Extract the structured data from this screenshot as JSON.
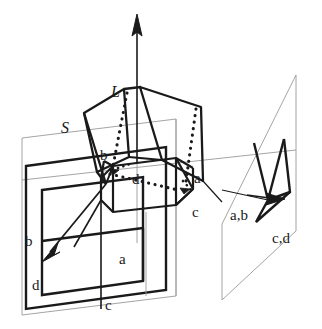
{
  "figure": {
    "background_color": "#ffffff",
    "ink_color": "#1a1a1a",
    "thin_line_color": "#8c8c8c",
    "width": 322,
    "height": 329
  },
  "labels": {
    "line_L": "L",
    "surface_S": "S",
    "left_plane": {
      "corner_b": "b",
      "corner_a": "a",
      "corner_d": "d",
      "corner_c": "c"
    },
    "surface_corners": {
      "corner_b": "b",
      "corner_d": "d",
      "corner_a": "a",
      "corner_c": "c"
    },
    "right_plane": {
      "corner_ab": "a,b",
      "corner_cd": "c,d"
    }
  },
  "geometry": {
    "axis_arrow": {
      "name": "vertical-axis-L",
      "from": [
        137,
        163
      ],
      "to": [
        137,
        16
      ]
    },
    "left_image_plane_outline": [
      [
        22,
        138
      ],
      [
        176,
        119
      ],
      [
        176,
        296
      ],
      [
        22,
        315
      ]
    ],
    "left_plane_thick_quad": [
      [
        26,
        166
      ],
      [
        166,
        147
      ],
      [
        166,
        290
      ],
      [
        26,
        309
      ]
    ],
    "left_plane_inner_quad": [
      [
        42,
        190
      ],
      [
        143,
        176
      ],
      [
        143,
        281
      ],
      [
        42,
        295
      ]
    ],
    "left_plane_arrow": {
      "from": [
        103,
        187
      ],
      "to": [
        47,
        255
      ]
    },
    "left_plane_edge_ab": [
      [
        42,
        240
      ],
      [
        143,
        226
      ]
    ],
    "left_plane_edge_ad": [
      [
        42,
        240
      ],
      [
        42,
        295
      ]
    ],
    "left_plane_edge_ac": [
      [
        143,
        226
      ],
      [
        143,
        281
      ]
    ],
    "right_image_plane_outline": [
      [
        222,
        224
      ],
      [
        296,
        75
      ],
      [
        296,
        231
      ],
      [
        222,
        300
      ]
    ],
    "right_plane_strokes": [
      [
        [
          257,
          143
        ],
        [
          268,
          199
        ]
      ],
      [
        [
          268,
          199
        ],
        [
          256,
          221
        ]
      ],
      [
        [
          256,
          221
        ],
        [
          288,
          192
        ]
      ],
      [
        [
          288,
          192
        ],
        [
          283,
          139
        ]
      ],
      [
        [
          283,
          139
        ],
        [
          268,
          199
        ]
      ]
    ],
    "right_plane_arrow": {
      "from": [
        253,
        196
      ],
      "to": [
        281,
        199
      ]
    },
    "surface_S_top_left_face": [
      [
        84,
        114
      ],
      [
        123,
        90
      ],
      [
        129,
        156
      ],
      [
        98,
        171
      ]
    ],
    "surface_S_top_right_face": [
      [
        140,
        88
      ],
      [
        200,
        107
      ],
      [
        202,
        180
      ],
      [
        163,
        160
      ]
    ],
    "surface_S_ridge": [
      [
        123,
        90
      ],
      [
        140,
        88
      ]
    ],
    "surface_S_dotted_left": [
      [
        123,
        92
      ],
      [
        113,
        165
      ]
    ],
    "surface_S_dotted_right": [
      [
        194,
        108
      ],
      [
        186,
        180
      ]
    ],
    "inner_prism_top_left": [
      [
        104,
        160
      ],
      [
        172,
        152
      ]
    ],
    "inner_prism_top_right": [
      [
        172,
        152
      ],
      [
        205,
        166
      ]
    ],
    "inner_prism_front": [
      [
        100,
        176
      ],
      [
        167,
        170
      ],
      [
        167,
        206
      ],
      [
        100,
        198
      ]
    ],
    "inner_prism_dotted_back": [
      [
        106,
        172
      ],
      [
        175,
        186
      ]
    ]
  },
  "label_positions": {
    "L": [
      118,
      92
    ],
    "S": [
      68,
      128
    ],
    "left_b": [
      30,
      240
    ],
    "left_a": [
      124,
      258
    ],
    "left_d": [
      37,
      284
    ],
    "left_c": [
      110,
      304
    ],
    "surface_b": [
      105,
      155
    ],
    "surface_d": [
      137,
      179
    ],
    "surface_a": [
      199,
      178
    ],
    "surface_c": [
      196,
      212
    ],
    "right_ab": [
      236,
      214
    ],
    "right_cd": [
      276,
      236
    ]
  }
}
